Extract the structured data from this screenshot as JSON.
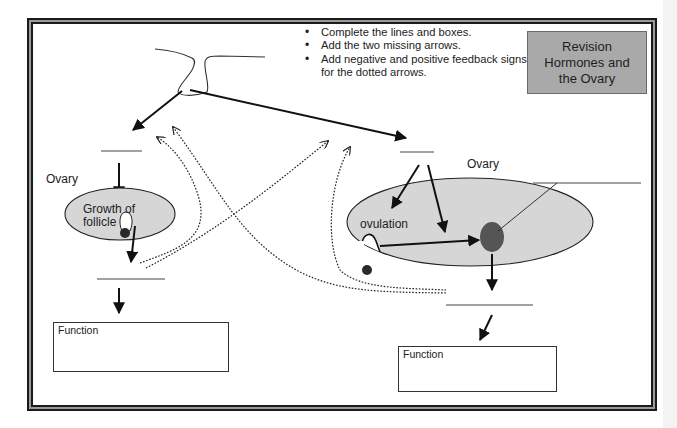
{
  "title_box": {
    "lines": [
      "Revision",
      "Hormones and",
      "the Ovary"
    ],
    "background": "#a9a9a9"
  },
  "instructions": [
    "Complete the lines and boxes.",
    "Add the two missing arrows.",
    "Add negative and positive feedback signs for the dotted arrows."
  ],
  "left_panel": {
    "ovary_label": "Ovary",
    "ellipse_text_line1": "Growth of",
    "ellipse_text_line2": "follicle",
    "function_box_label": "Function"
  },
  "right_panel": {
    "ovary_label": "Ovary",
    "ovulation_label": "ovulation",
    "function_box_label": "Function"
  },
  "colors": {
    "ovary_fill": "#d6d6d6",
    "dark_body": "#555555",
    "egg": "#2a2a2a",
    "line": "#111111"
  }
}
